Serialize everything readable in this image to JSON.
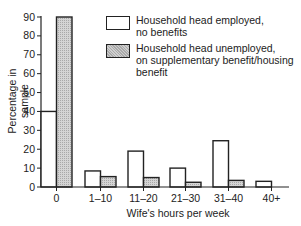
{
  "chart_data": {
    "type": "bar",
    "title": "",
    "xlabel": "Wife's hours per week",
    "ylabel": "Percentage in sample",
    "categories": [
      "0",
      "1–10",
      "11–20",
      "21–30",
      "31–40",
      "40+"
    ],
    "series": [
      {
        "name": "Household head employed, no benefits",
        "fill": "white",
        "values": [
          40,
          8.5,
          19,
          10,
          24.5,
          3
        ]
      },
      {
        "name": "Household head unemployed, on supplementary benefit/housing benefit",
        "fill": "hatched-grey",
        "values": [
          90,
          5.5,
          5,
          2.5,
          3.5,
          0
        ]
      }
    ],
    "ylim": [
      0,
      90
    ],
    "yticks": [
      0,
      10,
      20,
      30,
      40,
      50,
      60,
      70,
      80,
      90
    ],
    "grid": false,
    "legend_position": "upper right"
  },
  "legend": {
    "items": [
      {
        "label_line1": "Household head employed,",
        "label_line2": "no benefits",
        "label_line3": ""
      },
      {
        "label_line1": "Household head unemployed,",
        "label_line2": "on supplementary benefit/housing",
        "label_line3": "benefit"
      }
    ]
  },
  "axes": {
    "xlabel": "Wife's hours per week",
    "ylabel": "Percentage in sample"
  },
  "colors": {
    "axis": "#222222",
    "white_bar": "#ffffff",
    "shaded_bar": "#cfcfcf"
  }
}
